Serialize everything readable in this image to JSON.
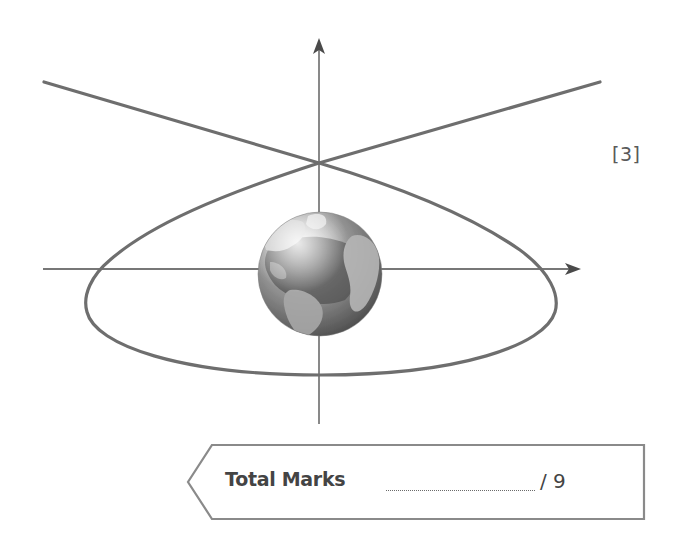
{
  "diagram": {
    "axes": {
      "x_axis": {
        "from": [
          43,
          269
        ],
        "to": [
          581,
          269
        ],
        "arrow": true
      },
      "y_axis": {
        "from": [
          319,
          424
        ],
        "to": [
          319,
          38
        ],
        "arrow": true
      }
    },
    "orbit_curve": {
      "stroke_color": "#6e6e6e",
      "crossing_point": [
        319,
        163
      ]
    },
    "earth": {
      "center": [
        320,
        274
      ],
      "radius": 62,
      "ocean_color": "#5a5a5a",
      "land_color": "#bdbdbd"
    },
    "axis_color": "#4a4a4a"
  },
  "question_marks": "[3]",
  "total_marks": {
    "label": "Total Marks",
    "max": "/ 9",
    "border_color": "#8a8a8a"
  }
}
